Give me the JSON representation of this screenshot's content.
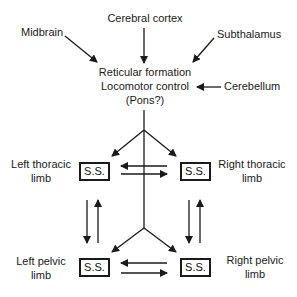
{
  "diagram": {
    "inputs": {
      "cerebral_cortex": "Cerebral cortex",
      "midbrain": "Midbrain",
      "subthalamus": "Subthalamus",
      "cerebellum": "Cerebellum"
    },
    "center": {
      "line1": "Reticular formation",
      "line2": "Locomotor control",
      "line3": "(Pons?)"
    },
    "limbs": {
      "left_thoracic": {
        "line1": "Left thoracic",
        "line2": "limb",
        "box": "S.S."
      },
      "right_thoracic": {
        "line1": "Right thoracic",
        "line2": "limb",
        "box": "S.S."
      },
      "left_pelvic": {
        "line1": "Left pelvic",
        "line2": "limb",
        "box": "S.S."
      },
      "right_pelvic": {
        "line1": "Right pelvic",
        "line2": "limb",
        "box": "S.S."
      }
    }
  }
}
